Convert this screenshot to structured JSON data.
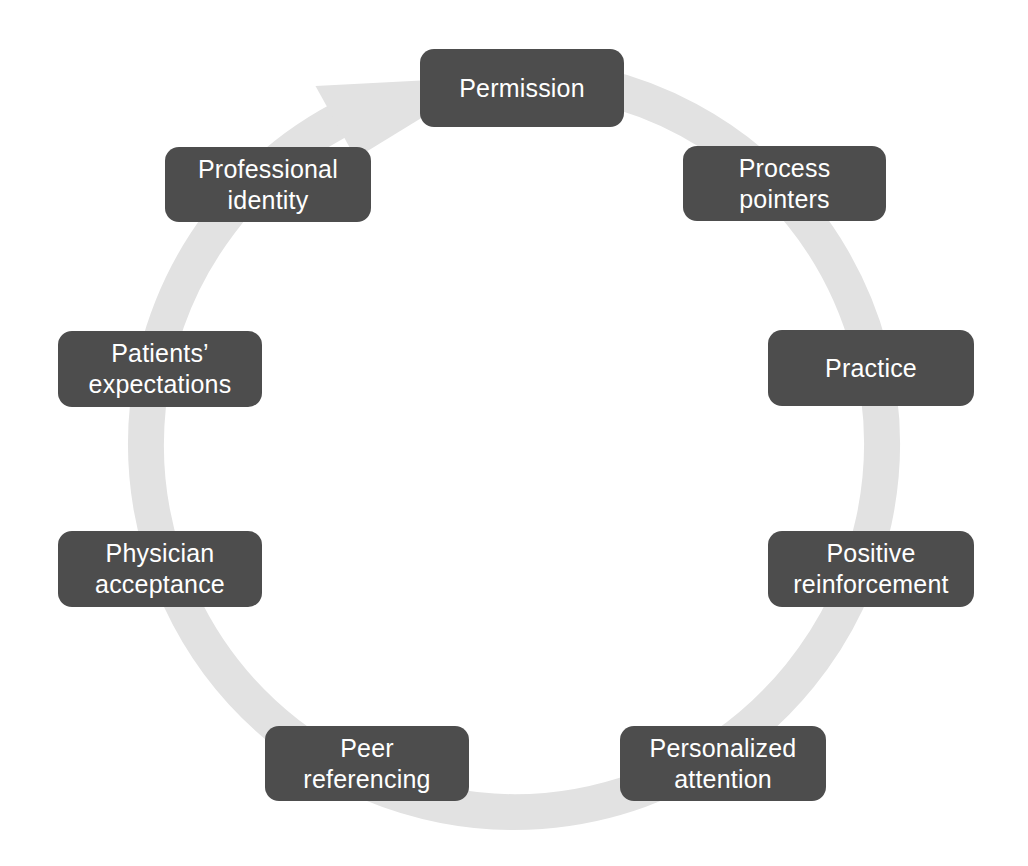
{
  "diagram": {
    "type": "cycle",
    "title": "",
    "direction": "clockwise",
    "ring": {
      "color": "#e2e2e2",
      "center_x": 514,
      "center_y": 444,
      "radius": 368,
      "thickness": 36,
      "arrowhead": "clockwise-arrow-icon"
    },
    "node_style": {
      "fill": "#4d4d4d",
      "text_color": "#ffffff",
      "corner_radius": 14
    },
    "nodes": [
      {
        "id": "permission",
        "label": "Permission",
        "position": "top",
        "x": 420,
        "y": 49,
        "w": 204,
        "h": 78
      },
      {
        "id": "process-pointers",
        "label": "Process\npointers",
        "position": "top-right",
        "x": 683,
        "y": 146,
        "w": 203,
        "h": 75
      },
      {
        "id": "practice",
        "label": "Practice",
        "position": "right-upper",
        "x": 768,
        "y": 330,
        "w": 206,
        "h": 76
      },
      {
        "id": "positive-reinforcement",
        "label": "Positive\nreinforcement",
        "position": "right-lower",
        "x": 768,
        "y": 531,
        "w": 206,
        "h": 76
      },
      {
        "id": "personalized-attention",
        "label": "Personalized\nattention",
        "position": "bottom-right",
        "x": 620,
        "y": 726,
        "w": 206,
        "h": 75
      },
      {
        "id": "peer-referencing",
        "label": "Peer\nreferencing",
        "position": "bottom-left",
        "x": 265,
        "y": 726,
        "w": 204,
        "h": 75
      },
      {
        "id": "physician-acceptance",
        "label": "Physician\nacceptance",
        "position": "left-lower",
        "x": 58,
        "y": 531,
        "w": 204,
        "h": 76
      },
      {
        "id": "patients-expectations",
        "label": "Patients’\nexpectations",
        "position": "left-upper",
        "x": 58,
        "y": 331,
        "w": 204,
        "h": 76
      },
      {
        "id": "professional-identity",
        "label": "Professional\nidentity",
        "position": "top-left",
        "x": 165,
        "y": 147,
        "w": 206,
        "h": 75
      }
    ]
  }
}
